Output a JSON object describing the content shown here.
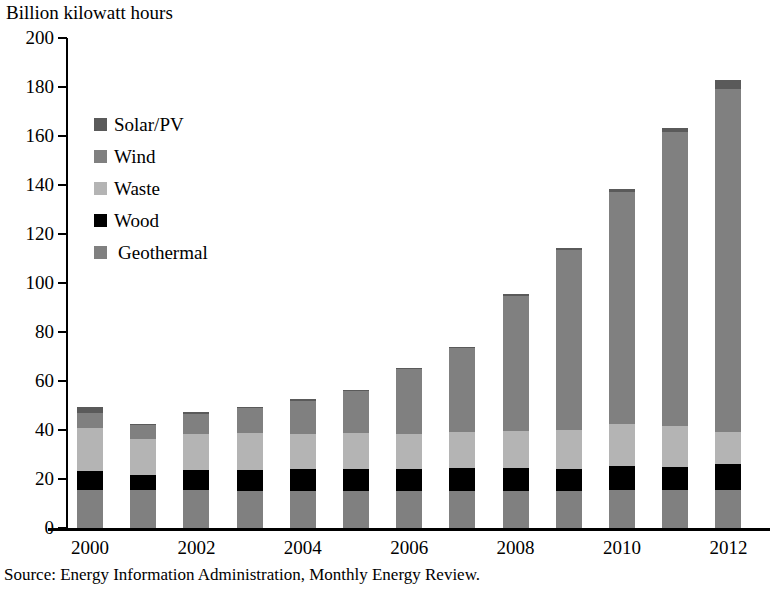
{
  "chart_data": {
    "type": "bar",
    "subtype": "stacked-vertical",
    "title": "",
    "ylabel": "Billion kilowatt hours",
    "xlabel": "",
    "ylim": [
      0,
      200
    ],
    "ytick_step": 20,
    "yticks": [
      0,
      20,
      40,
      60,
      80,
      100,
      120,
      140,
      160,
      180,
      200
    ],
    "grid": false,
    "legend_position": "upper-left-inside",
    "categories": [
      2000,
      2001,
      2002,
      2003,
      2004,
      2005,
      2006,
      2007,
      2008,
      2009,
      2010,
      2011,
      2012
    ],
    "xtick_labels": [
      "2000",
      "2002",
      "2004",
      "2006",
      "2008",
      "2010",
      "2012"
    ],
    "stack_order_bottom_to_top": [
      "Geothermal",
      "Wood",
      "Waste",
      "Wind",
      "Solar/PV"
    ],
    "series": [
      {
        "name": "Geothermal",
        "color": "#808080",
        "values": [
          15.5,
          15.5,
          15.5,
          15.0,
          15.0,
          15.0,
          15.0,
          15.0,
          15.0,
          15.0,
          15.5,
          15.5,
          15.5
        ]
      },
      {
        "name": "Wood",
        "color": "#000000",
        "values": [
          7.8,
          6.0,
          8.0,
          8.6,
          9.0,
          9.2,
          9.0,
          9.3,
          9.3,
          9.0,
          10.0,
          9.5,
          10.5
        ]
      },
      {
        "name": "Waste",
        "color": "#b4b4b4",
        "values": [
          17.5,
          15.0,
          15.0,
          15.0,
          14.5,
          14.5,
          14.5,
          15.0,
          15.5,
          16.0,
          17.0,
          16.5,
          13.0
        ]
      },
      {
        "name": "Wind",
        "color": "#808080",
        "values": [
          6.0,
          5.5,
          8.0,
          10.4,
          13.5,
          17.3,
          26.5,
          34.0,
          55.0,
          73.5,
          94.5,
          120.0,
          140.0
        ]
      },
      {
        "name": "Solar/PV",
        "color": "#5a5a5a",
        "values": [
          2.7,
          0.5,
          0.8,
          0.5,
          0.5,
          0.5,
          0.5,
          0.6,
          0.8,
          0.8,
          1.2,
          1.8,
          4.0
        ]
      }
    ],
    "totals": [
      49.5,
      42.5,
      47.3,
      49.5,
      52.5,
      56.5,
      65.5,
      73.9,
      95.6,
      114.3,
      138.2,
      163.3,
      183.0
    ],
    "legend_entries": [
      "Solar/PV",
      "Wind",
      "Waste",
      "Wood",
      "Geothermal"
    ],
    "source_note": "Source: Energy Information Administration, Monthly Energy Review."
  },
  "legend": {
    "items": [
      {
        "label": "Solar/PV",
        "color": "#5a5a5a",
        "indented": false
      },
      {
        "label": "Wind",
        "color": "#808080",
        "indented": false
      },
      {
        "label": "Waste",
        "color": "#b4b4b4",
        "indented": false
      },
      {
        "label": "Wood",
        "color": "#000000",
        "indented": false
      },
      {
        "label": "Geothermal",
        "color": "#808080",
        "indented": true
      }
    ]
  },
  "axes": {
    "y_title": "Billion kilowatt hours",
    "y_tick_labels": [
      "200",
      "180",
      "160",
      "140",
      "120",
      "100",
      "80",
      "60",
      "40",
      "20",
      "0"
    ],
    "x_tick_labels": [
      "2000",
      "2002",
      "2004",
      "2006",
      "2008",
      "2010",
      "2012"
    ]
  },
  "footer": {
    "source": "Source: Energy Information Administration, Monthly Energy Review."
  }
}
